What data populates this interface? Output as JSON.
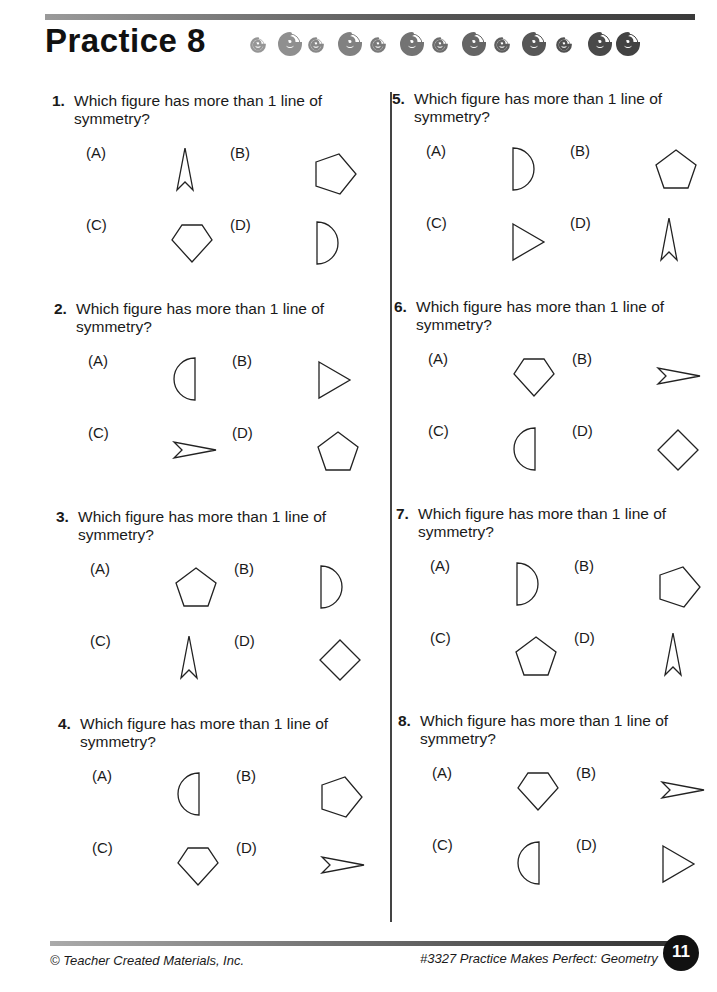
{
  "header": {
    "title": "Practice 8",
    "decoration": "spiral-shell-icons",
    "spiral_count": 13
  },
  "questions": [
    {
      "number": "1.",
      "text": "Which figure has more than 1 line of symmetry?",
      "options": [
        {
          "label": "(A)",
          "shape": "arrow-up"
        },
        {
          "label": "(B)",
          "shape": "pentagon-right"
        },
        {
          "label": "(C)",
          "shape": "pentagon-down"
        },
        {
          "label": "(D)",
          "shape": "semicircle-right"
        }
      ]
    },
    {
      "number": "2.",
      "text": "Which figure has more than 1 line of symmetry?",
      "options": [
        {
          "label": "(A)",
          "shape": "semicircle-left"
        },
        {
          "label": "(B)",
          "shape": "triangle-right"
        },
        {
          "label": "(C)",
          "shape": "arrow-right"
        },
        {
          "label": "(D)",
          "shape": "pentagon-up"
        }
      ]
    },
    {
      "number": "3.",
      "text": "Which figure has more than 1 line of symmetry?",
      "options": [
        {
          "label": "(A)",
          "shape": "pentagon-up"
        },
        {
          "label": "(B)",
          "shape": "semicircle-right"
        },
        {
          "label": "(C)",
          "shape": "arrow-up"
        },
        {
          "label": "(D)",
          "shape": "diamond"
        }
      ]
    },
    {
      "number": "4.",
      "text": "Which figure has more than 1 line of symmetry?",
      "options": [
        {
          "label": "(A)",
          "shape": "semicircle-left"
        },
        {
          "label": "(B)",
          "shape": "pentagon-right"
        },
        {
          "label": "(C)",
          "shape": "pentagon-down"
        },
        {
          "label": "(D)",
          "shape": "arrow-right"
        }
      ]
    },
    {
      "number": "5.",
      "text": "Which figure has more than 1 line of symmetry?",
      "options": [
        {
          "label": "(A)",
          "shape": "semicircle-right"
        },
        {
          "label": "(B)",
          "shape": "pentagon-up"
        },
        {
          "label": "(C)",
          "shape": "triangle-right"
        },
        {
          "label": "(D)",
          "shape": "arrow-up"
        }
      ]
    },
    {
      "number": "6.",
      "text": "Which figure has more than 1 line of symmetry?",
      "options": [
        {
          "label": "(A)",
          "shape": "pentagon-down"
        },
        {
          "label": "(B)",
          "shape": "arrow-right"
        },
        {
          "label": "(C)",
          "shape": "semicircle-left"
        },
        {
          "label": "(D)",
          "shape": "diamond"
        }
      ]
    },
    {
      "number": "7.",
      "text": "Which figure has more than 1 line of symmetry?",
      "options": [
        {
          "label": "(A)",
          "shape": "semicircle-right"
        },
        {
          "label": "(B)",
          "shape": "pentagon-right"
        },
        {
          "label": "(C)",
          "shape": "pentagon-up"
        },
        {
          "label": "(D)",
          "shape": "arrow-up"
        }
      ]
    },
    {
      "number": "8.",
      "text": "Which figure has more than 1 line of symmetry?",
      "options": [
        {
          "label": "(A)",
          "shape": "pentagon-down"
        },
        {
          "label": "(B)",
          "shape": "arrow-right"
        },
        {
          "label": "(C)",
          "shape": "semicircle-left"
        },
        {
          "label": "(D)",
          "shape": "triangle-right"
        }
      ]
    }
  ],
  "footer": {
    "copyright": "© Teacher Created Materials, Inc.",
    "book": "#3327 Practice Makes Perfect: Geometry",
    "page_number": "11"
  }
}
